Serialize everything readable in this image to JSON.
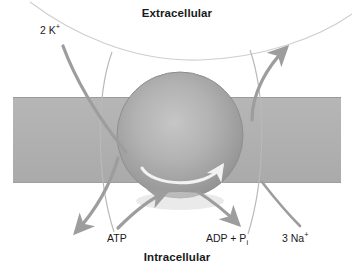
{
  "figure": {
    "type": "diagram"
  },
  "labels": {
    "extracellular": "Extracellular",
    "intracellular": "Intracellular",
    "potassium_count": "2 K",
    "potassium_charge": "+",
    "atp": "ATP",
    "adp": "ADP + P",
    "adp_subscript": "i",
    "sodium_count": "3 Na",
    "sodium_charge": "+"
  },
  "colors": {
    "membrane": "#b0b0b0",
    "membrane_edge": "#9a9a9a",
    "protein_light": "#bdbdbd",
    "protein_mid": "#a6a6a6",
    "protein_dark": "#8c8c8c",
    "arrow": "#9d9d9d",
    "thin_curve": "#cfcfcf",
    "inner_arrow": "#f2f2f2",
    "text": "#1a1a1a",
    "background": "#ffffff"
  },
  "geometry": {
    "membrane": {
      "x": 13,
      "y": 97,
      "width": 328,
      "height": 86
    },
    "protein_sphere": {
      "cx": 180,
      "cy": 135,
      "r": 63
    }
  }
}
